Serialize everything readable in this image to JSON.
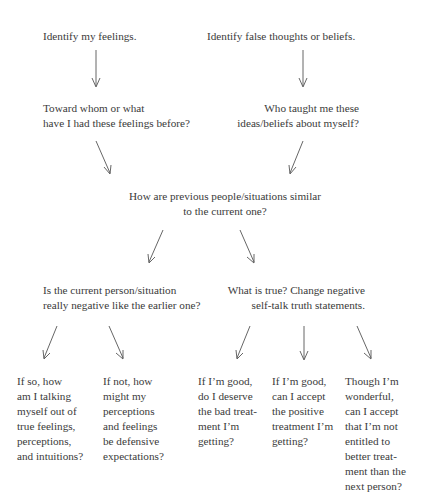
{
  "diagram": {
    "type": "flowchart",
    "nodes": {
      "identify_feelings": {
        "lines": [
          "Identify my feelings."
        ]
      },
      "identify_false_thoughts": {
        "lines": [
          "Identify false thoughts or beliefs."
        ]
      },
      "toward_whom": {
        "lines": [
          "Toward whom or what",
          "have I had these feelings before?"
        ]
      },
      "who_taught": {
        "lines": [
          "Who taught me these",
          "ideas/beliefs about myself?"
        ]
      },
      "how_similar": {
        "lines": [
          "How are previous people/situations similar",
          "to the current one?"
        ]
      },
      "is_negative": {
        "lines": [
          "Is the current person/situation",
          "really negative like the earlier one?"
        ]
      },
      "what_is_true": {
        "lines": [
          "What is true? Change negative",
          "self-talk truth statements."
        ]
      },
      "if_so": {
        "lines": [
          "If so, how",
          "am I talking",
          "myself out of",
          "true feelings,",
          "perceptions,",
          "and intuitions?"
        ]
      },
      "if_not": {
        "lines": [
          "If not, how",
          "might my",
          "perceptions",
          "and feelings",
          "be defensive",
          "expectations?"
        ]
      },
      "if_good_bad": {
        "lines": [
          "If I’m good,",
          "do I deserve",
          "the bad treat-",
          "ment I’m",
          "getting?"
        ]
      },
      "if_good_positive": {
        "lines": [
          "If I’m good,",
          "can I accept",
          "the positive",
          "treatment I’m",
          "getting?"
        ]
      },
      "though_wonderful": {
        "lines": [
          "Though I’m",
          "wonderful,",
          "can I accept",
          "that I’m not",
          "entitled to",
          "better treat-",
          "ment than the",
          "next person?"
        ]
      }
    },
    "edges": [
      [
        "identify_feelings",
        "toward_whom"
      ],
      [
        "identify_false_thoughts",
        "who_taught"
      ],
      [
        "toward_whom",
        "how_similar"
      ],
      [
        "who_taught",
        "how_similar"
      ],
      [
        "how_similar",
        "is_negative"
      ],
      [
        "how_similar",
        "what_is_true"
      ],
      [
        "is_negative",
        "if_so"
      ],
      [
        "is_negative",
        "if_not"
      ],
      [
        "what_is_true",
        "if_good_bad"
      ],
      [
        "what_is_true",
        "if_good_positive"
      ],
      [
        "what_is_true",
        "though_wonderful"
      ]
    ]
  }
}
